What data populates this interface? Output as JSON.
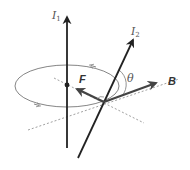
{
  "diagram": {
    "labels": {
      "current_1": "I",
      "current_1_sub": "1",
      "current_2": "I",
      "current_2_sub": "2",
      "force": "F",
      "field": "B",
      "angle": "θ"
    },
    "colors": {
      "wire": "#222222",
      "vector": "#444444",
      "circle": "#777777",
      "dashed": "#888888",
      "label": "#555555"
    }
  }
}
